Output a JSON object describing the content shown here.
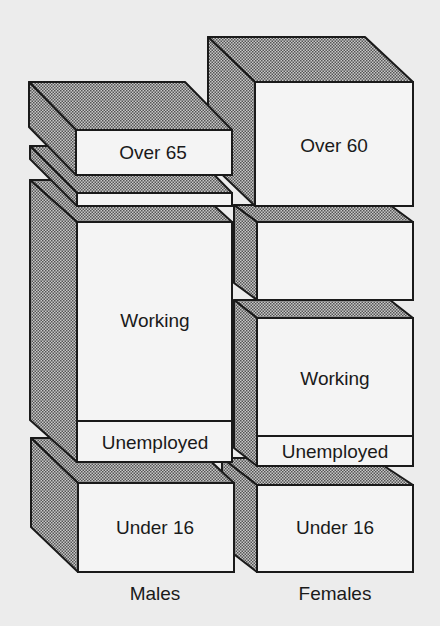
{
  "diagram": {
    "type": "3d stacked block diagram",
    "columns": [
      {
        "label": "Males",
        "segments": [
          {
            "label": "Over 65"
          },
          {
            "label": ""
          },
          {
            "label": "Working"
          },
          {
            "label": "Unemployed"
          },
          {
            "label": "Under 16"
          }
        ]
      },
      {
        "label": "Females",
        "segments": [
          {
            "label": "Over 60"
          },
          {
            "label": ""
          },
          {
            "label": "Working"
          },
          {
            "label": "Unemployed"
          },
          {
            "label": "Under 16"
          }
        ]
      }
    ]
  },
  "colors": {
    "front_face": "#f4f4f4",
    "shaded_face": "#9a9a9a",
    "outline": "#1a1a1a",
    "background": "#ececec"
  }
}
